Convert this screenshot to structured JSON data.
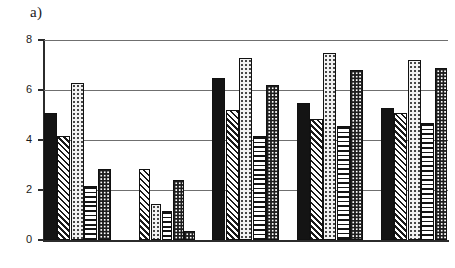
{
  "figure": {
    "panel_label": "a)",
    "background": "#ffffff",
    "axis_color": "#2b2b2b",
    "grid_color": "#6f6f6f"
  },
  "chart_data": {
    "type": "bar",
    "title": "a)",
    "xlabel": "",
    "ylabel": "",
    "ylim": [
      0,
      8
    ],
    "yticks": [
      0,
      2,
      4,
      6,
      8
    ],
    "ytick_labels": [
      "0",
      "2",
      "4",
      "6",
      "8"
    ],
    "grid": true,
    "grid_axis": "y",
    "legend": false,
    "legend_position": "none",
    "categories": [
      "1",
      "2",
      "3",
      "4",
      "5"
    ],
    "xtick_labels": [
      "",
      "",
      "",
      "",
      ""
    ],
    "series": [
      {
        "name": "Series 1",
        "pattern": "solid-black",
        "values": [
          5.1,
          0.0,
          6.5,
          5.5,
          5.3
        ]
      },
      {
        "name": "Series 2",
        "pattern": "diagonal-hatch",
        "values": [
          4.15,
          2.85,
          5.2,
          4.85,
          5.1
        ]
      },
      {
        "name": "Series 3",
        "pattern": "light-stipple",
        "values": [
          6.3,
          1.45,
          7.3,
          7.5,
          7.2
        ]
      },
      {
        "name": "Series 4",
        "pattern": "horizontal-lines",
        "values": [
          2.15,
          1.15,
          4.15,
          4.55,
          4.7
        ]
      },
      {
        "name": "Series 5",
        "pattern": "checkered-dots",
        "values": [
          2.85,
          2.4,
          6.2,
          6.8,
          6.9
        ]
      }
    ],
    "group_bar_values": [
      [
        5.1,
        4.15,
        6.3,
        2.15,
        2.85
      ],
      [
        0.0,
        2.85,
        1.45,
        1.15,
        2.4
      ],
      [
        6.5,
        5.2,
        7.3,
        4.15,
        6.2
      ],
      [
        5.5,
        4.85,
        7.5,
        4.55,
        6.8
      ],
      [
        5.3,
        5.1,
        7.2,
        4.7,
        6.9
      ]
    ],
    "extra_bars": [
      {
        "group": 2,
        "after_index": 4,
        "value": 0.35,
        "pattern": "checkered-dots"
      }
    ]
  }
}
